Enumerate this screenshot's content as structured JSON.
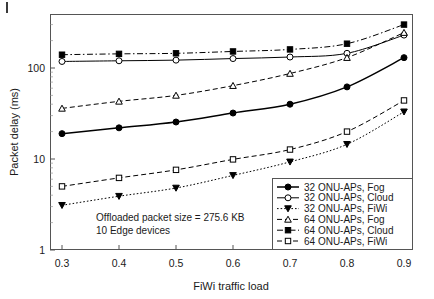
{
  "chart_data": {
    "type": "line",
    "title": "",
    "xlabel": "FiWi traffic load",
    "ylabel": "Packet delay (ms)",
    "yscale": "log",
    "ylim": [
      1,
      400
    ],
    "xlim": [
      0.27,
      0.93
    ],
    "grid": false,
    "legend_position": "bottom-right",
    "x": [
      0.3,
      0.4,
      0.5,
      0.6,
      0.7,
      0.8,
      0.9
    ],
    "xtick_labels": [
      "0.3",
      "0.4",
      "0.5",
      "0.6",
      "0.7",
      "0.8",
      "0.9"
    ],
    "ytick_labels": [
      "1",
      "10",
      "100"
    ],
    "ytick_values": [
      1,
      10,
      100
    ],
    "series": [
      {
        "name": "32 ONU-APs, Fog",
        "marker": "filled-circle",
        "linestyle": "solid",
        "values": [
          19,
          22,
          25.5,
          32,
          40,
          62,
          130
        ]
      },
      {
        "name": "32 ONU-APs, Cloud",
        "marker": "open-circle",
        "linestyle": "solid",
        "values": [
          118,
          120,
          122,
          127,
          132,
          145,
          230
        ]
      },
      {
        "name": "32 ONU-APs, FiWi",
        "marker": "filled-triangle-down",
        "linestyle": "dotted",
        "values": [
          3.1,
          3.9,
          4.8,
          6.6,
          9.3,
          14.5,
          33
        ]
      },
      {
        "name": "64 ONU-APs, Fog",
        "marker": "open-triangle-up",
        "linestyle": "dashed",
        "values": [
          36,
          43,
          50,
          64,
          87,
          130,
          245
        ]
      },
      {
        "name": "64 ONU-APs, Cloud",
        "marker": "filled-square",
        "linestyle": "dash-dot",
        "values": [
          140,
          143,
          145,
          152,
          160,
          185,
          300
        ]
      },
      {
        "name": "64 ONU-APs, FiWi",
        "marker": "open-square",
        "linestyle": "dashed",
        "values": [
          5.0,
          6.2,
          7.6,
          9.9,
          12.7,
          20,
          44
        ]
      }
    ],
    "annotations": [
      "Offloaded packet size = 275.6 KB",
      "10 Edge devices"
    ]
  }
}
